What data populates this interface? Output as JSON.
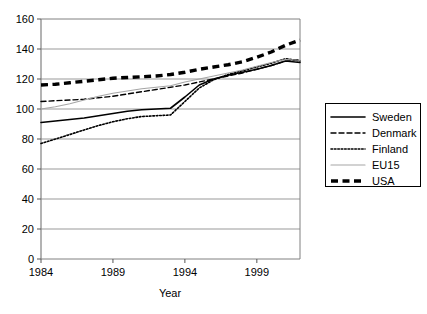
{
  "chart_data": {
    "type": "line",
    "title": "",
    "xlabel": "Year",
    "ylabel": "",
    "xlim": [
      1984,
      2002
    ],
    "ylim": [
      0,
      160
    ],
    "grid": true,
    "grid_axis": "y",
    "legend_position": "right-outside",
    "x_ticks": [
      1984,
      1989,
      1994,
      1999
    ],
    "x_tick_labels": [
      "1984",
      "1989",
      "1994",
      "1999"
    ],
    "y_ticks": [
      0,
      20,
      40,
      60,
      80,
      100,
      120,
      140,
      160
    ],
    "y_tick_labels": [
      "0",
      "20",
      "40",
      "60",
      "80",
      "100",
      "120",
      "140",
      "160"
    ],
    "x": [
      1984,
      1985,
      1986,
      1987,
      1988,
      1989,
      1990,
      1991,
      1992,
      1993,
      1994,
      1995,
      1996,
      1997,
      1998,
      1999,
      2000,
      2001,
      2002
    ],
    "series": [
      {
        "name": "Sweden",
        "style": "solid",
        "color": "#000000",
        "width": 1.6,
        "values": [
          91,
          92,
          93,
          94,
          95.5,
          97,
          98.5,
          99.5,
          100,
          100.5,
          108,
          116,
          120,
          122.5,
          124.5,
          126.5,
          129,
          132,
          131
        ]
      },
      {
        "name": "Denmark",
        "style": "dashed",
        "color": "#000000",
        "width": 1.4,
        "values": [
          105,
          105.5,
          106,
          106.5,
          107.5,
          108.5,
          110,
          111.5,
          113,
          114.5,
          116,
          118,
          120,
          122,
          124,
          126.5,
          129,
          132,
          133
        ]
      },
      {
        "name": "Finland",
        "style": "dotted",
        "color": "#000000",
        "width": 1.6,
        "values": [
          77,
          80,
          83,
          86,
          89,
          91.5,
          93.5,
          95,
          95.5,
          96,
          105,
          114,
          119.5,
          123,
          125.5,
          128,
          130.5,
          133.5,
          132
        ]
      },
      {
        "name": "EU15",
        "style": "solid",
        "color": "#a6a6a6",
        "width": 1.2,
        "values": [
          100,
          101.5,
          103.5,
          106,
          108.5,
          110.5,
          112,
          113.5,
          114.5,
          115.5,
          118,
          120,
          122,
          124,
          126,
          128.5,
          131,
          133,
          132.5
        ]
      },
      {
        "name": "USA",
        "style": "thick-dashed",
        "color": "#000000",
        "width": 3.4,
        "values": [
          116,
          116.5,
          117.5,
          118.5,
          119.5,
          120.5,
          121,
          121.5,
          122,
          123,
          124.5,
          126.5,
          128,
          129.5,
          131.5,
          134.5,
          138,
          142.5,
          146
        ]
      }
    ]
  },
  "legend": {
    "entries": [
      {
        "label": "Sweden"
      },
      {
        "label": "Denmark"
      },
      {
        "label": "Finland"
      },
      {
        "label": "EU15"
      },
      {
        "label": "USA"
      }
    ]
  }
}
